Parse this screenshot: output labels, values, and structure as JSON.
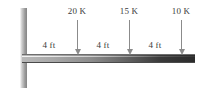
{
  "figure": {
    "type": "cantilever-beam-load-diagram",
    "support": {
      "kind": "fixed-wall",
      "position_label": ""
    },
    "beam": {
      "total_length_ft": 12,
      "orientation": "horizontal"
    },
    "loads": [
      {
        "label": "20 K",
        "magnitude": 20,
        "unit": "K",
        "direction": "down",
        "x_px": 77,
        "distance_from_wall_ft": 4
      },
      {
        "label": "15 K",
        "magnitude": 15,
        "unit": "K",
        "direction": "down",
        "x_px": 129,
        "distance_from_wall_ft": 8
      },
      {
        "label": "10 K",
        "magnitude": 10,
        "unit": "K",
        "direction": "down",
        "x_px": 181,
        "distance_from_wall_ft": 12
      }
    ],
    "dimensions": [
      {
        "label": "4 ft",
        "value": 4,
        "unit": "ft",
        "x_px": 49
      },
      {
        "label": "4 ft",
        "value": 4,
        "unit": "ft",
        "x_px": 103
      },
      {
        "label": "4 ft",
        "value": 4,
        "unit": "ft",
        "x_px": 155
      }
    ],
    "colors": {
      "arrow": "#8b8b8b",
      "text": "#3b3b3b",
      "beam_dark": "#2b2b2b",
      "beam_light": "#b9b9b9",
      "wall_light": "#e4e4e4",
      "wall_dark": "#8f8f8f",
      "background": "#ffffff"
    }
  }
}
